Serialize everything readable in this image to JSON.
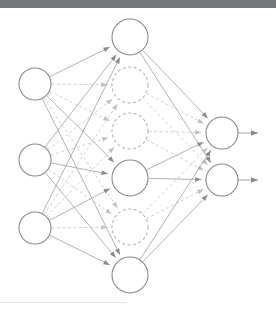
{
  "figure": {
    "width": 276,
    "height": 315,
    "background_color": "#ffffff",
    "top_band_color": "#77787a",
    "top_band_height": 8,
    "bottom_rule_color": "#e3e3e5",
    "bottom_rule_width": 126,
    "bottom_rule_y": 302
  },
  "style": {
    "node_stroke_active": "#8a8a90",
    "node_stroke_dropped": "#b6b6bc",
    "node_fill": "#ffffff",
    "edge_active_color": "#9a9aa0",
    "edge_dropped_color": "#c0c0c6",
    "arrow_color": "#8a8a90",
    "node_stroke_width": 1.1,
    "edge_stroke_width": 0.75,
    "dash_pattern": "3,2.5"
  },
  "layers": [
    {
      "id": "input",
      "name": "input-layer",
      "label": "Input layer",
      "x": 35,
      "radius": 16,
      "nodes": [
        {
          "id": "i1",
          "label": "input-node-1",
          "y": 84,
          "state": "active"
        },
        {
          "id": "i2",
          "label": "input-node-2",
          "y": 160,
          "state": "active"
        },
        {
          "id": "i3",
          "label": "input-node-3",
          "y": 228,
          "state": "active"
        }
      ]
    },
    {
      "id": "hidden",
      "name": "hidden-layer",
      "label": "Hidden layer",
      "x": 130,
      "radius": 18,
      "nodes": [
        {
          "id": "h1",
          "label": "hidden-node-1",
          "y": 37,
          "state": "active"
        },
        {
          "id": "h2",
          "label": "hidden-node-2",
          "y": 85,
          "state": "dropped"
        },
        {
          "id": "h3",
          "label": "hidden-node-3",
          "y": 131,
          "state": "dropped"
        },
        {
          "id": "h4",
          "label": "hidden-node-4",
          "y": 178,
          "state": "active"
        },
        {
          "id": "h5",
          "label": "hidden-node-5",
          "y": 227,
          "state": "dropped"
        },
        {
          "id": "h6",
          "label": "hidden-node-6",
          "y": 275,
          "state": "active"
        }
      ]
    },
    {
      "id": "output",
      "name": "output-layer",
      "label": "Output layer",
      "x": 222,
      "radius": 16,
      "nodes": [
        {
          "id": "o1",
          "label": "output-node-1",
          "y": 133,
          "state": "active"
        },
        {
          "id": "o2",
          "label": "output-node-2",
          "y": 180,
          "state": "active"
        }
      ]
    }
  ],
  "output_arrows": [
    {
      "id": "oa1",
      "label": "output-arrow-1",
      "from_x": 238,
      "to_x": 265,
      "y": 133
    },
    {
      "id": "oa2",
      "label": "output-arrow-2",
      "from_x": 238,
      "to_x": 265,
      "y": 180
    }
  ],
  "edges_input_to_hidden": [
    {
      "from": "i1",
      "to": "h1",
      "state": "active"
    },
    {
      "from": "i1",
      "to": "h2",
      "state": "dropped"
    },
    {
      "from": "i1",
      "to": "h3",
      "state": "dropped"
    },
    {
      "from": "i1",
      "to": "h4",
      "state": "active"
    },
    {
      "from": "i1",
      "to": "h5",
      "state": "dropped"
    },
    {
      "from": "i1",
      "to": "h6",
      "state": "active"
    },
    {
      "from": "i2",
      "to": "h1",
      "state": "active"
    },
    {
      "from": "i2",
      "to": "h2",
      "state": "dropped"
    },
    {
      "from": "i2",
      "to": "h3",
      "state": "dropped"
    },
    {
      "from": "i2",
      "to": "h4",
      "state": "active"
    },
    {
      "from": "i2",
      "to": "h5",
      "state": "dropped"
    },
    {
      "from": "i2",
      "to": "h6",
      "state": "active"
    },
    {
      "from": "i3",
      "to": "h1",
      "state": "active"
    },
    {
      "from": "i3",
      "to": "h2",
      "state": "dropped"
    },
    {
      "from": "i3",
      "to": "h3",
      "state": "dropped"
    },
    {
      "from": "i3",
      "to": "h4",
      "state": "active"
    },
    {
      "from": "i3",
      "to": "h5",
      "state": "dropped"
    },
    {
      "from": "i3",
      "to": "h6",
      "state": "active"
    }
  ],
  "edges_hidden_to_output": [
    {
      "from": "h1",
      "to": "o1",
      "state": "active"
    },
    {
      "from": "h1",
      "to": "o2",
      "state": "active"
    },
    {
      "from": "h2",
      "to": "o1",
      "state": "dropped"
    },
    {
      "from": "h2",
      "to": "o2",
      "state": "dropped"
    },
    {
      "from": "h3",
      "to": "o1",
      "state": "dropped"
    },
    {
      "from": "h3",
      "to": "o2",
      "state": "dropped"
    },
    {
      "from": "h4",
      "to": "o1",
      "state": "active"
    },
    {
      "from": "h4",
      "to": "o2",
      "state": "active"
    },
    {
      "from": "h5",
      "to": "o1",
      "state": "dropped"
    },
    {
      "from": "h5",
      "to": "o2",
      "state": "dropped"
    },
    {
      "from": "h6",
      "to": "o1",
      "state": "active"
    },
    {
      "from": "h6",
      "to": "o2",
      "state": "active"
    }
  ]
}
